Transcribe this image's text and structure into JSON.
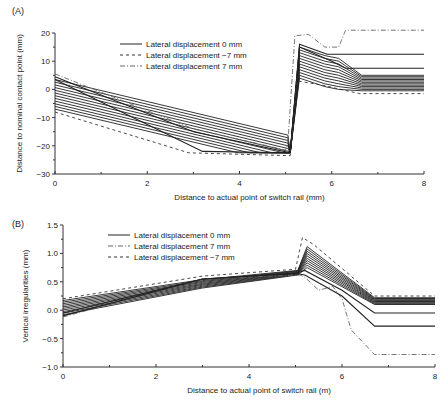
{
  "chart_data": [
    {
      "panel_label": "(A)",
      "type": "line",
      "title": "",
      "xlabel": "Distance to actual point of switch rail (mm)",
      "ylabel": "Distance to nominal contact point (mm)",
      "xlim": [
        0,
        8
      ],
      "ylim": [
        -30,
        20
      ],
      "xticks": [
        0,
        2,
        4,
        6,
        8
      ],
      "yticks": [
        20,
        10,
        0,
        -10,
        -20,
        -30
      ],
      "grid": false,
      "legend_position": "upper-left-center",
      "legend": [
        {
          "label": "Lateral displacement 0 mm",
          "style": "solid"
        },
        {
          "label": "Lateral displacement −7 mm",
          "style": "dashed"
        },
        {
          "label": "Lateral displacement 7 mm",
          "style": "dashdot"
        }
      ],
      "series": [
        {
          "name": "Lateral displacement 7 mm",
          "style": "dashdot",
          "x": [
            0,
            3.0,
            5.0,
            5.05,
            5.2,
            5.5,
            5.85,
            6.15,
            6.3,
            8.0
          ],
          "y": [
            5.5,
            -14,
            -21.5,
            -19,
            19,
            19.5,
            15,
            15,
            21,
            21
          ]
        },
        {
          "name": "Lateral displacement 0 mm (upper bound)",
          "style": "solid",
          "x": [
            0,
            3.0,
            5.1,
            5.3,
            5.9,
            8.0
          ],
          "y": [
            4.5,
            -15,
            -22.5,
            16,
            12.5,
            12.5
          ]
        },
        {
          "name": "Lateral displacement 0 mm (family 2)",
          "style": "solid",
          "x": [
            0,
            3.2,
            5.1,
            5.3,
            6.0,
            6.3,
            8.0
          ],
          "y": [
            3.5,
            -22,
            -22.5,
            15,
            10,
            7.5,
            7.5
          ]
        },
        {
          "name": "Lateral displacement −7 mm",
          "style": "dashed",
          "x": [
            0,
            2.9,
            5.1,
            5.25,
            5.8,
            6.6,
            8.0
          ],
          "y": [
            -8,
            -22.5,
            -23.5,
            3,
            1.5,
            -1.5,
            -1.5
          ]
        }
      ],
      "family_lines": {
        "count": 12,
        "style": "solid",
        "start_y_range": [
          3.5,
          -7
        ],
        "flat_min_y": -22.5,
        "jump_x": 5.15,
        "peak_y_range": [
          15,
          4
        ],
        "end_y_range": [
          5,
          -0.5
        ]
      }
    },
    {
      "panel_label": "(B)",
      "type": "line",
      "title": "",
      "xlabel": "Distance to actual point of switch rail (m)",
      "ylabel": "Vertical irregularities (mm)",
      "xlim": [
        0,
        8
      ],
      "ylim": [
        -1.0,
        1.5
      ],
      "xticks": [
        0,
        2,
        4,
        6,
        8
      ],
      "yticks": [
        1.5,
        1.0,
        0.5,
        0.0,
        -0.5,
        -1.0
      ],
      "grid": false,
      "legend_position": "upper-left-center",
      "legend": [
        {
          "label": "Lateral displacement 0 mm",
          "style": "solid"
        },
        {
          "label": "Lateral displacement 7 mm",
          "style": "dashdot"
        },
        {
          "label": "Lateral displacement −7 mm",
          "style": "dashed"
        }
      ],
      "series": [
        {
          "name": "Lateral displacement −7 mm",
          "style": "dashed",
          "x": [
            0,
            3.0,
            5.0,
            5.15,
            5.4,
            6.7,
            8.0
          ],
          "y": [
            0.2,
            0.6,
            0.72,
            1.28,
            1.15,
            0.25,
            0.25
          ]
        },
        {
          "name": "Lateral displacement 7 mm",
          "style": "dashdot",
          "x": [
            0,
            3.0,
            5.1,
            5.2,
            5.5,
            5.8,
            6.0,
            6.2,
            6.7,
            8.0
          ],
          "y": [
            -0.12,
            0.55,
            0.62,
            0.58,
            0.35,
            0.42,
            0.2,
            -0.35,
            -0.78,
            -0.78
          ]
        },
        {
          "name": "Lateral displacement 0 mm (lower)",
          "style": "solid",
          "x": [
            0,
            3.0,
            5.0,
            5.2,
            6.0,
            6.7,
            8.0
          ],
          "y": [
            -0.1,
            0.55,
            0.65,
            0.62,
            0.25,
            -0.28,
            -0.28
          ]
        },
        {
          "name": "Lateral displacement 0 mm (2nd lower)",
          "style": "solid",
          "x": [
            0,
            3.0,
            5.0,
            5.2,
            6.0,
            6.7,
            8.0
          ],
          "y": [
            -0.05,
            0.55,
            0.65,
            0.7,
            0.35,
            -0.05,
            -0.05
          ]
        }
      ],
      "family_lines": {
        "count": 10,
        "style": "solid",
        "start_y_range": [
          0.17,
          -0.08
        ],
        "x_knee": 5.05,
        "knee_y_range": [
          0.7,
          0.62
        ],
        "peak_x": 5.25,
        "peak_y_range": [
          1.12,
          0.75
        ],
        "flat_start_x": 6.7,
        "end_y_range": [
          0.22,
          0.1
        ]
      }
    }
  ]
}
